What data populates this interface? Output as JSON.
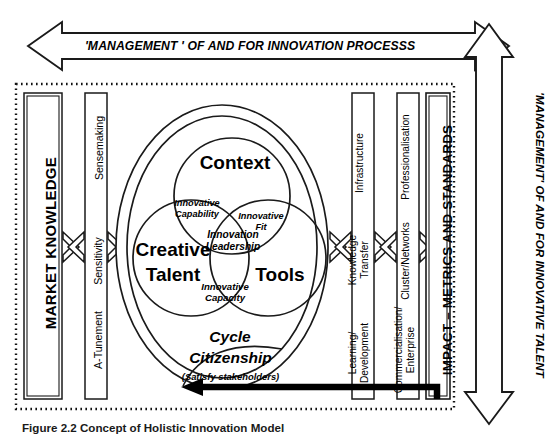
{
  "figure": {
    "caption": "Figure 2.2  Concept of Holistic Innovation Model"
  },
  "arrows": {
    "top_horizontal": {
      "label": "'MANAGEMENT ' OF AND FOR INNOVATION PROCESSS",
      "style": "double-headed-outline-arrow",
      "direction": "horizontal"
    },
    "right_vertical": {
      "label": "'MANAGEMENT' OF AND FOR INNOVATIVE TALENT",
      "style": "double-headed-outline-arrow",
      "direction": "vertical"
    },
    "feedback": {
      "name": "impact-feedback-arrow",
      "style": "thick-black-curved-arrow",
      "from": "IMPACT – METRICS AND STANDARDS",
      "to": "Cycle Citizenship"
    },
    "connectors": [
      {
        "name": "market-to-sensitivity",
        "style": "outline-chevron"
      },
      {
        "name": "sensitivity-to-core",
        "style": "outline-chevron"
      },
      {
        "name": "core-to-knowledge",
        "style": "outline-chevron"
      },
      {
        "name": "knowledge-to-cluster",
        "style": "outline-chevron"
      },
      {
        "name": "cluster-to-impact",
        "style": "outline-chevron"
      }
    ]
  },
  "left": {
    "market_knowledge": "MARKET KNOWLEDGE",
    "capabilities": [
      "Sensemaking",
      "Sensitivity",
      "A-Tunement"
    ]
  },
  "core": {
    "outer_ring_labels": {
      "cycle": "Cycle",
      "citizenship": "Citizenship",
      "satisfy": "(Satisfy stakeholders)"
    },
    "circles": [
      {
        "name": "context",
        "label": "Context"
      },
      {
        "name": "creative-talent",
        "label_line1": "Creative",
        "label_line2": "Talent"
      },
      {
        "name": "tools",
        "label": "Tools"
      }
    ],
    "intersections": [
      {
        "name": "innovative-capability",
        "line1": "Innovative",
        "line2": "Capability"
      },
      {
        "name": "innovative-fit",
        "line1": "Innovative",
        "line2": "Fit"
      },
      {
        "name": "innovation-leadership",
        "line1": "Innovation",
        "line2": "Leadership"
      },
      {
        "name": "innovative-capacity",
        "line1": "Innovative",
        "line2": "Capacity"
      }
    ]
  },
  "right": {
    "column_one": [
      "Infrastructure",
      "Knowledge\nTransfer",
      "Learning/\nDevelopment"
    ],
    "column_one_items": {
      "infrastructure": "Infrastructure",
      "knowledge_transfer_l1": "Knowledge",
      "knowledge_transfer_l2": "Transfer",
      "learning_l1": "Learning/",
      "learning_l2": "Development"
    },
    "column_two_items": {
      "professionalisation": "Professionalisation",
      "cluster_networks": "Cluster/Networks",
      "commercialisation_l1": "Commercialisation/",
      "commercialisation_l2": "Enterprise"
    },
    "impact": "IMPACT – METRICS AND STANDARDS"
  },
  "colors": {
    "ink": "#000000",
    "background": "#ffffff"
  }
}
